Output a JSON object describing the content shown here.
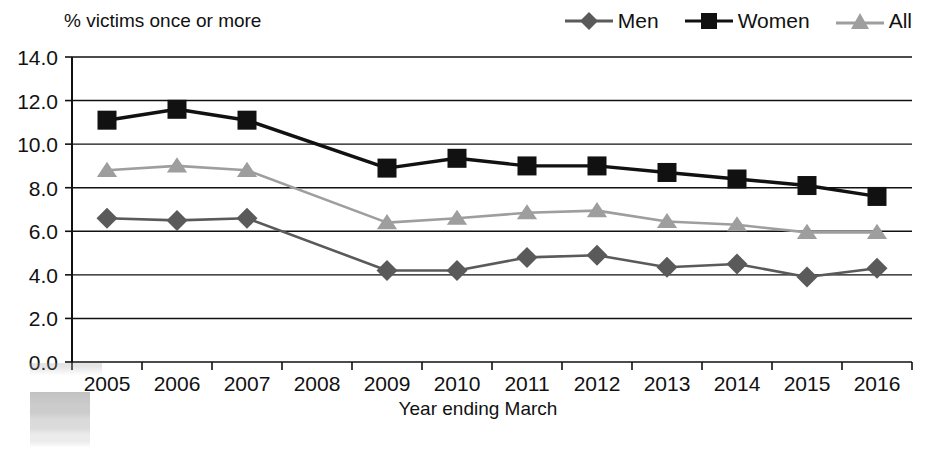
{
  "chart_data": {
    "type": "line",
    "title": "",
    "ylabel": "% victims once or more",
    "xlabel": "Year ending March",
    "categories": [
      "2005",
      "2006",
      "2007",
      "2008",
      "2009",
      "2010",
      "2011",
      "2012",
      "2013",
      "2014",
      "2015",
      "2016"
    ],
    "ylim": [
      0.0,
      14.0
    ],
    "ytick_labels": [
      "14.0",
      "12.0",
      "10.0",
      "8.0",
      "6.0",
      "4.0",
      "2.0",
      "0.0"
    ],
    "ytick_values": [
      14.0,
      12.0,
      10.0,
      8.0,
      6.0,
      4.0,
      2.0,
      0.0
    ],
    "grid": "horizontal",
    "legend_position": "top-right",
    "series": [
      {
        "name": "Men",
        "marker": "diamond",
        "color": "#5a5a5a",
        "values": [
          6.6,
          6.5,
          6.6,
          null,
          4.2,
          4.2,
          4.8,
          4.9,
          4.35,
          4.5,
          3.9,
          4.3
        ]
      },
      {
        "name": "Women",
        "marker": "square",
        "color": "#111111",
        "values": [
          11.1,
          11.6,
          11.1,
          null,
          8.9,
          9.35,
          9.0,
          9.0,
          8.7,
          8.4,
          8.1,
          7.6
        ]
      },
      {
        "name": "All",
        "marker": "triangle",
        "color": "#9e9e9e",
        "values": [
          8.8,
          9.0,
          8.8,
          null,
          6.4,
          6.6,
          6.85,
          6.95,
          6.45,
          6.3,
          5.95,
          5.95
        ]
      }
    ]
  },
  "legend": {
    "entries": [
      {
        "label": "Men",
        "marker": "diamond",
        "color": "#5a5a5a"
      },
      {
        "label": "Women",
        "marker": "square",
        "color": "#111111"
      },
      {
        "label": "All",
        "marker": "triangle",
        "color": "#9e9e9e"
      }
    ]
  },
  "axes": {
    "y_title": "% victims once or more",
    "x_title": "Year ending March"
  }
}
